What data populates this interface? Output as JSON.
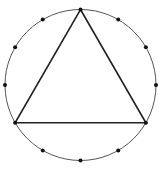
{
  "diagram": {
    "width": 164,
    "height": 174,
    "circle": {
      "cx": 80.5,
      "cy": 85,
      "r": 75.5,
      "stroke": "#555555",
      "stroke_width": 1
    },
    "points": {
      "count": 12,
      "radius": 2,
      "fill": "#111111",
      "start_angle_deg": 0,
      "step_deg": 30
    },
    "triangle": {
      "vertex_indices": [
        0,
        4,
        8
      ],
      "stroke": "#222222",
      "stroke_width": 1.6
    }
  }
}
